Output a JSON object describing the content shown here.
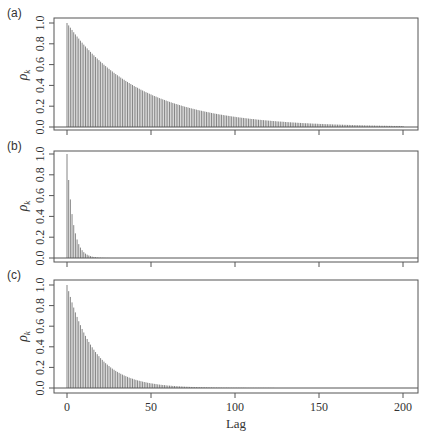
{
  "figure": {
    "xlabel": "Lag",
    "ylabel_symbol": "ρ",
    "ylabel_subscript": "k",
    "bar_color": "#777777",
    "axis_color": "#555555"
  },
  "chart_data": [
    {
      "type": "bar",
      "panel": "(a)",
      "title": "",
      "xlabel": "Lag",
      "ylabel": "ρ_k",
      "xlim": [
        -8,
        208
      ],
      "ylim": [
        0,
        1
      ],
      "xticks": [
        0,
        50,
        100,
        150,
        200
      ],
      "yticks": [
        0.0,
        0.2,
        0.4,
        0.6,
        0.8,
        1.0
      ],
      "ytick_labels": [
        "0.0",
        "0.2",
        "0.4",
        "0.6",
        "0.8",
        "1.0"
      ],
      "show_xtick_labels": false,
      "grid": false,
      "note": "geometric decay, approx 0.977^k",
      "x_start": 0,
      "values": [
        1.0,
        0.977,
        0.955,
        0.933,
        0.911,
        0.89,
        0.87,
        0.85,
        0.83,
        0.811,
        0.792,
        0.774,
        0.756,
        0.739,
        0.722,
        0.705,
        0.689,
        0.673,
        0.658,
        0.643,
        0.628,
        0.614,
        0.599,
        0.586,
        0.572,
        0.559,
        0.546,
        0.534,
        0.521,
        0.509,
        0.498,
        0.486,
        0.475,
        0.464,
        0.454,
        0.443,
        0.433,
        0.423,
        0.413,
        0.404,
        0.394,
        0.385,
        0.377,
        0.368,
        0.359,
        0.351,
        0.343,
        0.335,
        0.328,
        0.32,
        0.313,
        0.305,
        0.298,
        0.292,
        0.285,
        0.278,
        0.272,
        0.266,
        0.26,
        0.254,
        0.248,
        0.242,
        0.237,
        0.231,
        0.226,
        0.221,
        0.216,
        0.211,
        0.206,
        0.201,
        0.196,
        0.192,
        0.188,
        0.183,
        0.179,
        0.175,
        0.171,
        0.167,
        0.163,
        0.159,
        0.156,
        0.152,
        0.149,
        0.145,
        0.142,
        0.139,
        0.135,
        0.132,
        0.129,
        0.126,
        0.123,
        0.12,
        0.118,
        0.115,
        0.112,
        0.11,
        0.107,
        0.105,
        0.102,
        0.1,
        0.098,
        0.095,
        0.093,
        0.091,
        0.089,
        0.087,
        0.085,
        0.083,
        0.081,
        0.079,
        0.077,
        0.076,
        0.074,
        0.072,
        0.07,
        0.069,
        0.067,
        0.066,
        0.064,
        0.063,
        0.061,
        0.06,
        0.058,
        0.057,
        0.056,
        0.054,
        0.053,
        0.052,
        0.051,
        0.05,
        0.048,
        0.047,
        0.046,
        0.045,
        0.044,
        0.043,
        0.042,
        0.041,
        0.04,
        0.039,
        0.038,
        0.037,
        0.036,
        0.036,
        0.035,
        0.034,
        0.033,
        0.032,
        0.032,
        0.031,
        0.03,
        0.029,
        0.029,
        0.028,
        0.027,
        0.027,
        0.026,
        0.026,
        0.025,
        0.024,
        0.024,
        0.023,
        0.023,
        0.022,
        0.022,
        0.021,
        0.021,
        0.02,
        0.02,
        0.019,
        0.019,
        0.018,
        0.018,
        0.017,
        0.017,
        0.017,
        0.016,
        0.016,
        0.015,
        0.015,
        0.015,
        0.014,
        0.014,
        0.014,
        0.013,
        0.013,
        0.013,
        0.012,
        0.012,
        0.012,
        0.012,
        0.011,
        0.011,
        0.011,
        0.01,
        0.01,
        0.01,
        0.01,
        0.01,
        0.009,
        0.009
      ]
    },
    {
      "type": "bar",
      "panel": "(b)",
      "title": "",
      "xlabel": "Lag",
      "ylabel": "ρ_k",
      "xlim": [
        -8,
        208
      ],
      "ylim": [
        0,
        1
      ],
      "xticks": [
        0,
        50,
        100,
        150,
        200
      ],
      "yticks": [
        0.0,
        0.2,
        0.4,
        0.6,
        0.8,
        1.0
      ],
      "ytick_labels": [
        "0.0",
        "0.2",
        "0.4",
        "0.6",
        "0.8",
        "1.0"
      ],
      "show_xtick_labels": false,
      "grid": false,
      "note": "geometric decay, approx 0.75^k",
      "x_start": 0,
      "values": [
        1.0,
        0.75,
        0.563,
        0.422,
        0.316,
        0.237,
        0.178,
        0.133,
        0.1,
        0.075,
        0.056,
        0.042,
        0.032,
        0.024,
        0.018,
        0.013,
        0.01,
        0.008,
        0.006,
        0.004,
        0.003,
        0.002,
        0.002,
        0.001,
        0.001,
        0.001,
        0,
        0,
        0,
        0,
        0,
        0,
        0,
        0,
        0,
        0,
        0,
        0,
        0,
        0,
        0,
        0,
        0,
        0,
        0,
        0,
        0,
        0,
        0,
        0,
        0,
        0,
        0,
        0,
        0,
        0,
        0,
        0,
        0,
        0,
        0,
        0,
        0,
        0,
        0,
        0,
        0,
        0,
        0,
        0,
        0,
        0,
        0,
        0,
        0,
        0,
        0,
        0,
        0,
        0,
        0,
        0,
        0,
        0,
        0,
        0,
        0,
        0,
        0,
        0,
        0,
        0,
        0,
        0,
        0,
        0,
        0,
        0,
        0,
        0,
        0,
        0,
        0,
        0,
        0,
        0,
        0,
        0,
        0,
        0,
        0,
        0,
        0,
        0,
        0,
        0,
        0,
        0,
        0,
        0,
        0,
        0,
        0,
        0,
        0,
        0,
        0,
        0,
        0,
        0,
        0,
        0,
        0,
        0,
        0,
        0,
        0,
        0,
        0,
        0,
        0,
        0,
        0,
        0,
        0,
        0,
        0,
        0,
        0,
        0,
        0,
        0,
        0,
        0,
        0,
        0,
        0,
        0,
        0,
        0,
        0,
        0,
        0,
        0,
        0,
        0,
        0,
        0,
        0,
        0,
        0,
        0,
        0,
        0,
        0,
        0,
        0,
        0,
        0,
        0,
        0,
        0,
        0,
        0,
        0,
        0,
        0,
        0,
        0,
        0,
        0,
        0,
        0,
        0,
        0,
        0,
        0,
        0,
        0,
        0,
        0,
        0,
        0,
        0,
        0,
        0,
        0,
        0,
        0,
        0,
        0
      ]
    },
    {
      "type": "bar",
      "panel": "(c)",
      "title": "",
      "xlabel": "Lag",
      "ylabel": "ρ_k",
      "xlim": [
        -8,
        208
      ],
      "ylim": [
        0,
        1
      ],
      "xticks": [
        0,
        50,
        100,
        150,
        200
      ],
      "xtick_labels": [
        "0",
        "50",
        "100",
        "150",
        "200"
      ],
      "yticks": [
        0.0,
        0.2,
        0.4,
        0.6,
        0.8,
        1.0
      ],
      "ytick_labels": [
        "0.0",
        "0.2",
        "0.4",
        "0.6",
        "0.8",
        "1.0"
      ],
      "show_xtick_labels": true,
      "grid": false,
      "note": "geometric decay, approx 0.94^k",
      "x_start": 0,
      "values": [
        1.0,
        0.94,
        0.884,
        0.831,
        0.781,
        0.734,
        0.69,
        0.648,
        0.61,
        0.573,
        0.539,
        0.506,
        0.476,
        0.447,
        0.421,
        0.395,
        0.372,
        0.349,
        0.328,
        0.309,
        0.29,
        0.273,
        0.256,
        0.241,
        0.227,
        0.213,
        0.2,
        0.188,
        0.177,
        0.166,
        0.156,
        0.147,
        0.138,
        0.13,
        0.122,
        0.115,
        0.108,
        0.101,
        0.095,
        0.09,
        0.084,
        0.079,
        0.074,
        0.07,
        0.066,
        0.062,
        0.058,
        0.055,
        0.051,
        0.048,
        0.045,
        0.043,
        0.04,
        0.038,
        0.035,
        0.033,
        0.031,
        0.029,
        0.028,
        0.026,
        0.024,
        0.023,
        0.022,
        0.02,
        0.019,
        0.018,
        0.017,
        0.016,
        0.015,
        0.014,
        0.013,
        0.012,
        0.012,
        0.011,
        0.01,
        0.01,
        0.009,
        0.009,
        0.008,
        0.008,
        0.007,
        0.007,
        0.007,
        0.006,
        0.006,
        0.005,
        0.005,
        0.005,
        0.004,
        0.004,
        0.004,
        0.004,
        0.003,
        0.003,
        0.003,
        0.003,
        0.003,
        0.002,
        0.002,
        0.002,
        0.002,
        0.002,
        0.002,
        0.002,
        0.002,
        0.002,
        0.002,
        0.001,
        0.001,
        0.001,
        0.001,
        0.001,
        0.001,
        0.001,
        0.001,
        0.001,
        0.001,
        0.001,
        0.001,
        0.001,
        0.001,
        0.001,
        0.001,
        0.001,
        0,
        0,
        0,
        0,
        0,
        0,
        0,
        0,
        0,
        0,
        0,
        0,
        0,
        0,
        0,
        0,
        0,
        0,
        0,
        0,
        0,
        0,
        0,
        0,
        0,
        0,
        0,
        0,
        0,
        0,
        0,
        0,
        0,
        0,
        0,
        0,
        0,
        0,
        0,
        0,
        0,
        0,
        0,
        0,
        0,
        0,
        0,
        0,
        0,
        0,
        0,
        0,
        0,
        0,
        0,
        0,
        0,
        0,
        0,
        0,
        0,
        0,
        0,
        0,
        0,
        0,
        0,
        0,
        0,
        0,
        0,
        0,
        0,
        0,
        0,
        0,
        0,
        0,
        0
      ]
    }
  ]
}
